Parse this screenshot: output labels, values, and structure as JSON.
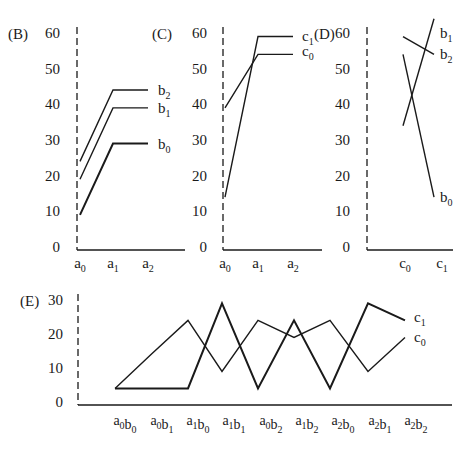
{
  "chart_data": [
    {
      "panel": "(B)",
      "type": "line",
      "x": [
        "a0",
        "a1",
        "a2"
      ],
      "yticks": [
        0,
        10,
        20,
        30,
        40,
        50,
        60
      ],
      "ylim": [
        0,
        60
      ],
      "series": [
        {
          "name": "b2",
          "values": [
            24,
            44,
            44
          ]
        },
        {
          "name": "b1",
          "values": [
            19,
            39,
            39
          ]
        },
        {
          "name": "b0",
          "values": [
            9,
            29,
            29
          ]
        }
      ]
    },
    {
      "panel": "(C)",
      "type": "line",
      "x": [
        "a0",
        "a1",
        "a2"
      ],
      "yticks": [
        0,
        10,
        20,
        30,
        40,
        50,
        60
      ],
      "ylim": [
        0,
        60
      ],
      "series": [
        {
          "name": "c1",
          "values": [
            14,
            59,
            59
          ]
        },
        {
          "name": "c0",
          "values": [
            39,
            54,
            54
          ]
        }
      ]
    },
    {
      "panel": "(D)",
      "type": "line",
      "x": [
        "c0",
        "c1"
      ],
      "yticks": [
        0,
        10,
        20,
        30,
        40,
        50,
        60
      ],
      "ylim": [
        0,
        60
      ],
      "series": [
        {
          "name": "b1",
          "values": [
            34,
            64
          ]
        },
        {
          "name": "b2",
          "values": [
            59,
            54
          ]
        },
        {
          "name": "b0",
          "values": [
            54,
            14
          ]
        }
      ]
    },
    {
      "panel": "(E)",
      "type": "line",
      "x": [
        "a0b0",
        "a0b1",
        "a1b0",
        "a1b1",
        "a0b2",
        "a1b2",
        "a2b0",
        "a2b1",
        "a2b2"
      ],
      "yticks": [
        0,
        10,
        20,
        30
      ],
      "ylim": [
        0,
        30
      ],
      "series": [
        {
          "name": "c1",
          "values": [
            4,
            4,
            4,
            29,
            4,
            24,
            4,
            29,
            24
          ]
        },
        {
          "name": "c0",
          "values": [
            4,
            14,
            24,
            9,
            24,
            19,
            24,
            9,
            19
          ]
        }
      ]
    }
  ],
  "panels": {
    "B": {
      "label": "(B)"
    },
    "C": {
      "label": "(C)"
    },
    "D": {
      "label": "(D)"
    },
    "E": {
      "label": "(E)"
    }
  }
}
